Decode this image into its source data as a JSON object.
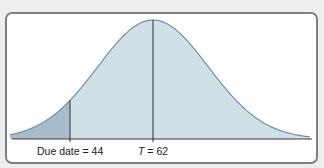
{
  "chart_data": {
    "type": "area",
    "title": "",
    "xlabel": "",
    "ylabel": "",
    "distribution": {
      "kind": "normal",
      "mean": 62,
      "std_dev_estimate": 12
    },
    "xlim": [
      31,
      96
    ],
    "grid": false,
    "legend": null,
    "markers": [
      {
        "name": "due_date",
        "label": "Due date = 44",
        "x": 44
      },
      {
        "name": "expected_time",
        "label_var": "T",
        "label_value": "= 62",
        "x": 62
      }
    ],
    "shaded_region": {
      "from": 31,
      "to": 44,
      "meaning": "probability of completing by due date"
    },
    "colors": {
      "curve_fill": "#cfe0e6",
      "shaded_tail": "#a8bccb",
      "curve_line": "#6f90a8",
      "axis_line": "#3a3a3a",
      "frame_border": "#7d7f82",
      "background": "#eceeef"
    }
  },
  "labels": {
    "due_date": "Due date = 44",
    "t_var": "T",
    "t_value": " = 62"
  }
}
